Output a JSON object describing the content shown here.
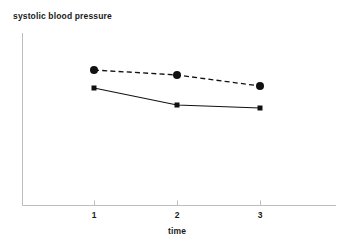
{
  "chart_data": {
    "type": "line",
    "title": "systolic blood pressure",
    "xlabel": "time",
    "ylabel": "",
    "x": [
      1,
      2,
      3
    ],
    "tick_labels": [
      "1",
      "2",
      "3"
    ],
    "xlim": [
      0.14,
      3.9
    ],
    "ylim": [
      0,
      100
    ],
    "grid": false,
    "legend": "none",
    "series": [
      {
        "name": "series-circles-dashed",
        "marker": "circle",
        "linestyle": "dashed",
        "color": "#111111",
        "marker_size": 8,
        "values": [
          78,
          75,
          69
        ]
      },
      {
        "name": "series-squares-solid",
        "marker": "square",
        "linestyle": "solid",
        "color": "#111111",
        "marker_size": 5,
        "values": [
          68,
          58,
          56
        ]
      }
    ],
    "axis_color": "#bdbdbd",
    "pixel_geometry": {
      "y_axis_x": 22,
      "y_axis_top": 33,
      "x_axis_y": 205,
      "x_axis_right": 336,
      "tick_x": [
        94,
        177,
        260
      ],
      "tick_len": 5,
      "series_circles_y": [
        70,
        75,
        86
      ],
      "series_squares_y": [
        88,
        105,
        108
      ]
    }
  }
}
